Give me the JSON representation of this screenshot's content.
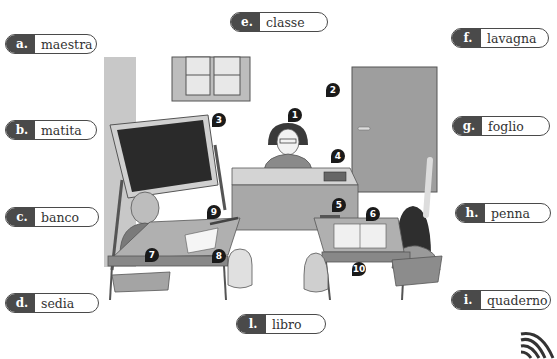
{
  "labels": [
    {
      "letter": "a.",
      "word": "maestra"
    },
    {
      "letter": "b.",
      "word": "matita"
    },
    {
      "letter": "c.",
      "word": "banco"
    },
    {
      "letter": "d.",
      "word": "sedia"
    },
    {
      "letter": "e.",
      "word": "classe"
    },
    {
      "letter": "f.",
      "word": "lavagna"
    },
    {
      "letter": "g.",
      "word": "foglio"
    },
    {
      "letter": "h.",
      "word": "penna"
    },
    {
      "letter": "i.",
      "word": "quaderno"
    },
    {
      "letter": "l.",
      "word": "libro"
    }
  ],
  "markers": [
    "1",
    "2",
    "3",
    "4",
    "5",
    "6",
    "7",
    "8",
    "9",
    "10"
  ],
  "colors": {
    "pill_dark": "#4a4a4a",
    "wall": "#c8c8c8",
    "door": "#9a9a9a",
    "board": "#2a2a2a",
    "desk": "#b5b5b5"
  }
}
